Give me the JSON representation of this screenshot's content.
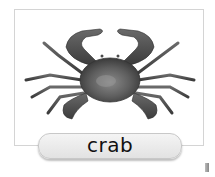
{
  "card": {
    "subject": "crab",
    "image_alt": "crab illustration",
    "label": "crab"
  },
  "colors": {
    "background": "#ffffff",
    "card_border": "#d4d4d4",
    "crab_shell": "#555555",
    "pill_fill": "#ececec",
    "label_text": "#111111"
  }
}
